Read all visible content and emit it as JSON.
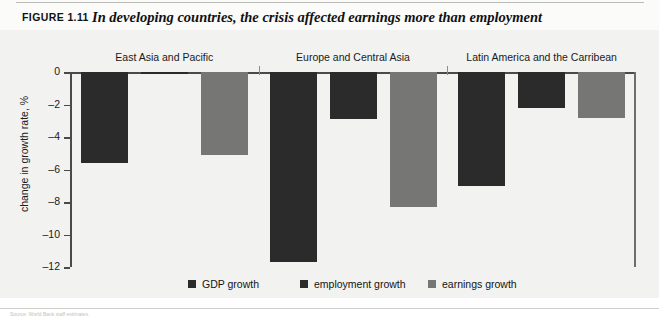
{
  "figure": {
    "number": "FIGURE 1.11",
    "title": "In developing countries, the crisis affected earnings more than employment",
    "source_note": "Source: World Bank staff estimates."
  },
  "legend": {
    "position": "bottom-center",
    "items": [
      {
        "label": "GDP growth",
        "color": "#2b2b2b"
      },
      {
        "label": "employment growth",
        "color": "#2b2b2b"
      },
      {
        "label": "earnings growth",
        "color": "#767675"
      }
    ]
  },
  "chart_data": {
    "type": "bar",
    "title": "In developing countries, the crisis affected earnings more than employment",
    "xlabel": "",
    "ylabel": "change in growth rate, %",
    "ylim": [
      -12,
      0
    ],
    "yticks": [
      0,
      -2,
      -4,
      -6,
      -8,
      -10,
      -12
    ],
    "ytick_labels": [
      "0",
      "–2",
      "–4",
      "–6",
      "–8",
      "–10",
      "–12"
    ],
    "grid": false,
    "orientation": "vertical",
    "categories": [
      "East Asia and Pacific",
      "Europe and Central Asia",
      "Latin America and the Carribean"
    ],
    "series": [
      {
        "name": "GDP growth",
        "color": "#2b2b2b",
        "values": [
          -5.6,
          -11.7,
          -7.0
        ]
      },
      {
        "name": "employment growth",
        "color": "#2b2b2b",
        "values": [
          -0.1,
          -2.9,
          -2.2
        ]
      },
      {
        "name": "earnings growth",
        "color": "#767675",
        "values": [
          -5.1,
          -8.3,
          -2.8
        ]
      }
    ]
  }
}
